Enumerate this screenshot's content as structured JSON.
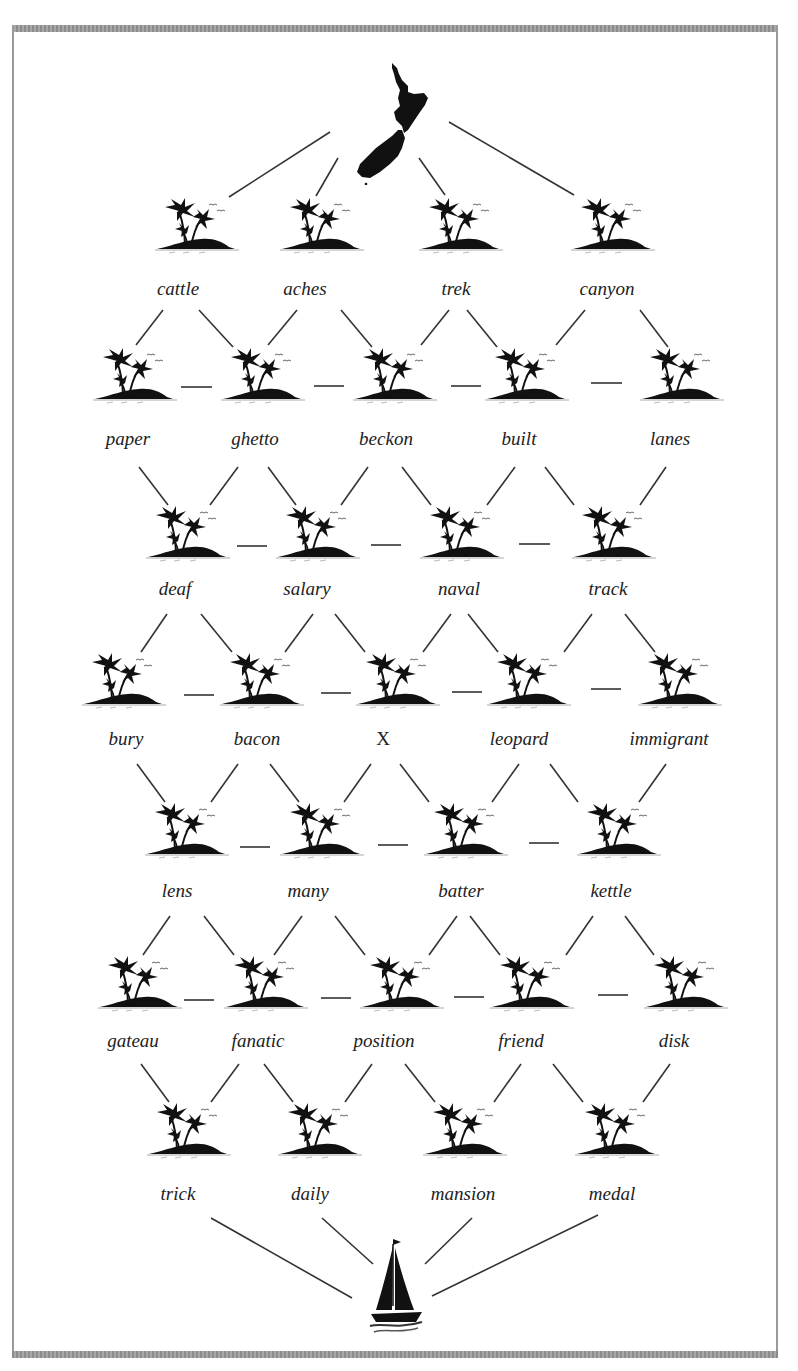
{
  "puzzle": {
    "start_icon": "new-zealand-map-icon",
    "end_icon": "sailboat-icon",
    "node_icon": "palm-island-icon",
    "colors": {
      "ink": "#111111",
      "frame": "#9a9a9a",
      "text": "#222222",
      "background": "#ffffff"
    },
    "rows": [
      {
        "type": "words",
        "words": [
          "cattle",
          "aches",
          "trek",
          "canyon"
        ]
      },
      {
        "type": "words",
        "words": [
          "paper",
          "ghetto",
          "beckon",
          "built",
          "lanes"
        ]
      },
      {
        "type": "words",
        "words": [
          "deaf",
          "salary",
          "naval",
          "track"
        ]
      },
      {
        "type": "words",
        "words": [
          "bury",
          "bacon",
          "X",
          "leopard",
          "immigrant"
        ]
      },
      {
        "type": "words",
        "words": [
          "lens",
          "many",
          "batter",
          "kettle"
        ]
      },
      {
        "type": "words",
        "words": [
          "gateau",
          "fanatic",
          "position",
          "friend",
          "disk"
        ]
      },
      {
        "type": "words",
        "words": [
          "trick",
          "daily",
          "mansion",
          "medal"
        ]
      }
    ],
    "unknown_marker": "X"
  }
}
